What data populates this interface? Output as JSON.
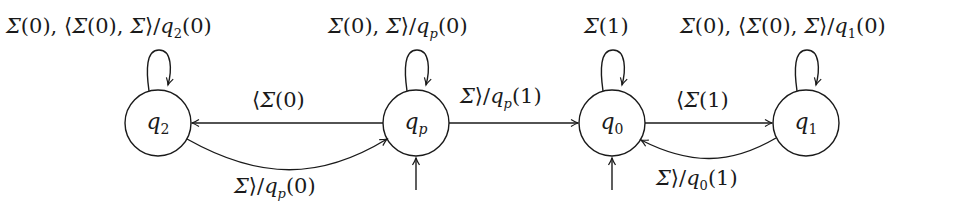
{
  "diagram": {
    "type": "finite-state-machine",
    "states": [
      {
        "id": "q2",
        "label": "q",
        "sub": "2",
        "cx": 158,
        "cy": 123,
        "r": 33
      },
      {
        "id": "qp",
        "label": "q",
        "sub": "p",
        "cx": 416,
        "cy": 123,
        "r": 33,
        "initial": true
      },
      {
        "id": "q0",
        "label": "q",
        "sub": "0",
        "cx": 612,
        "cy": 123,
        "r": 33,
        "initial": true
      },
      {
        "id": "q1",
        "label": "q",
        "sub": "1",
        "cx": 806,
        "cy": 123,
        "r": 33
      }
    ],
    "transitions": [
      {
        "from": "q2",
        "to": "q2",
        "label": "Σ(0), ⟨Σ(0), Σ⟩/q₂(0)"
      },
      {
        "from": "qp",
        "to": "qp",
        "label": "Σ(0), Σ⟩/q_p(0)"
      },
      {
        "from": "q0",
        "to": "q0",
        "label": "Σ(1)"
      },
      {
        "from": "q1",
        "to": "q1",
        "label": "Σ(0), ⟨Σ(0), Σ⟩/q₁(0)"
      },
      {
        "from": "qp",
        "to": "q2",
        "label": "⟨Σ(0)"
      },
      {
        "from": "q2",
        "to": "qp",
        "label": "Σ⟩/q_p(0)"
      },
      {
        "from": "qp",
        "to": "q0",
        "label": "Σ⟩/q_p(1)"
      },
      {
        "from": "q0",
        "to": "q1",
        "label": "⟨Σ(1)"
      },
      {
        "from": "q1",
        "to": "q0",
        "label": "Σ⟩/q₀(1)"
      }
    ]
  },
  "labels": {
    "loop_q2": {
      "a": "Σ",
      "b": "(0), ⟨",
      "c": "Σ",
      "d": "(0), ",
      "e": "Σ",
      "f": "⟩/",
      "g": "q",
      "h": "2",
      "i": "(0)"
    },
    "loop_qp": {
      "a": "Σ",
      "b": "(0), ",
      "c": "Σ",
      "d": "⟩/",
      "e": "q",
      "f": "p",
      "g": "(0)"
    },
    "loop_q0": {
      "a": "Σ",
      "b": "(1)"
    },
    "loop_q1": {
      "a": "Σ",
      "b": "(0), ⟨",
      "c": "Σ",
      "d": "(0), ",
      "e": "Σ",
      "f": "⟩/",
      "g": "q",
      "h": "1",
      "i": "(0)"
    },
    "qp_to_q2": {
      "a": "⟨",
      "b": "Σ",
      "c": "(0)"
    },
    "q2_to_qp": {
      "a": "Σ",
      "b": "⟩/",
      "c": "q",
      "d": "p",
      "e": "(0)"
    },
    "qp_to_q0": {
      "a": "Σ",
      "b": "⟩/",
      "c": "q",
      "d": "p",
      "e": "(1)"
    },
    "q0_to_q1": {
      "a": "⟨",
      "b": "Σ",
      "c": "(1)"
    },
    "q1_to_q0": {
      "a": "Σ",
      "b": "⟩/",
      "c": "q",
      "d": "0",
      "e": "(1)"
    }
  },
  "states_text": {
    "q2": {
      "q": "q",
      "sub": "2"
    },
    "qp": {
      "q": "q",
      "sub": "p"
    },
    "q0": {
      "q": "q",
      "sub": "0"
    },
    "q1": {
      "q": "q",
      "sub": "1"
    }
  },
  "colors": {
    "stroke": "#1a1a1a",
    "background": "#ffffff"
  }
}
